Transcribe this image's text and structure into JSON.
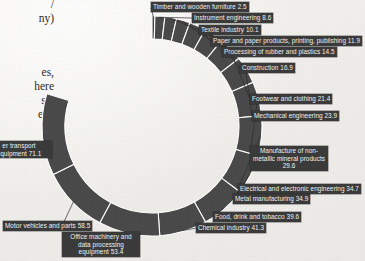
{
  "page": {
    "background_color": "#efeeea",
    "book_text_fragments": [
      "/",
      "ny)",
      "es,",
      "here",
      " set",
      "ead"
    ]
  },
  "chart_data": {
    "type": "pie",
    "variant": "donut",
    "title": "",
    "xlabel": "",
    "ylabel": "",
    "legend_position": "none",
    "grid": false,
    "segment_color": "#4a4a4a",
    "separator_color": "#ffffff",
    "label_background": "#3b3b3b",
    "label_text_color": "#f3f3f1",
    "order": "clockwise from top",
    "categories": [
      "Timber and wooden furniture",
      "Instrument engineering",
      "Textile industry",
      "Paper and paper products, printing, publishing",
      "Processing of rubber and plastics",
      "Construction",
      "Footwear and clothing",
      "Mechanical engineering",
      "Manufacture of non-metallic mineral products",
      "Electrical and electronic engineering",
      "Metal manufacturing",
      "Food, drink and tobacco",
      "Chemical industry",
      "Office machinery and data processing equipment",
      "Motor vehicles and parts",
      "Other transport equipment"
    ],
    "values": [
      2.5,
      8.6,
      10.1,
      11.9,
      14.5,
      16.9,
      21.4,
      23.9,
      29.6,
      34.7,
      34.9,
      39.6,
      41.3,
      53.4,
      58.5,
      71.1
    ]
  },
  "labels": [
    {
      "text": "Timber and wooden furniture 2.5"
    },
    {
      "text": "Instrument engineering 8.6"
    },
    {
      "text": "Textile industry 10.1"
    },
    {
      "text": "Paper and paper products, printing, publishing 11.9"
    },
    {
      "text": "Processing of rubber and plastics 14.5"
    },
    {
      "text": "Construction 16.9"
    },
    {
      "text": "Footwear and clothing 21.4"
    },
    {
      "text": "Mechanical engineering 23.9"
    },
    {
      "text": "Manufacture of non-metallic mineral products 29.6"
    },
    {
      "text": "Electrical and electronic engineering 34.7"
    },
    {
      "text": "Metal manufacturing 34.9"
    },
    {
      "text": "Food, drink and tobacco 39.6"
    },
    {
      "text": "Chemical industry 41.3"
    },
    {
      "text": "Office machinery and data processing equipment 53.4"
    },
    {
      "text": "Motor vehicles and parts 58.5"
    },
    {
      "text": "er transport equipment 71.1"
    }
  ]
}
